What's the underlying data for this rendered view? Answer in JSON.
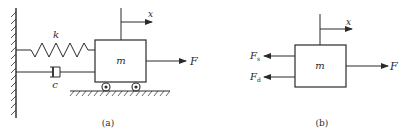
{
  "figure_a": {
    "caption": "(a)",
    "spring_label": "k",
    "damper_label": "c",
    "mass_label": "m",
    "force_label": "F",
    "displacement_label": "x"
  },
  "figure_b": {
    "caption": "(b)",
    "mass_label": "m",
    "force_label": "F",
    "displacement_label": "x",
    "spring_force": {
      "base": "F",
      "sub": "s"
    },
    "damper_force": {
      "base": "F",
      "sub": "d"
    }
  },
  "colors": {
    "line": "#2a2a2a",
    "background": "#ffffff"
  }
}
